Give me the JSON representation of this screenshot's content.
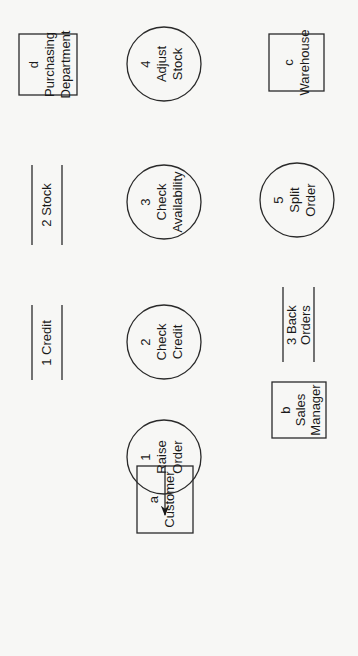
{
  "diagram": {
    "type": "data-flow-diagram",
    "orientation": "rotated -90deg",
    "colors": {
      "background": "#f7f7f5",
      "stroke": "#2a2a2a",
      "text": "#1a1a1a"
    },
    "external_entities": [
      {
        "id": "a",
        "name": "Customer"
      },
      {
        "id": "b",
        "name": "Sales Manager",
        "lines": [
          "Sales",
          "Manager"
        ]
      },
      {
        "id": "c",
        "name": "Warehouse"
      },
      {
        "id": "d",
        "name": "Purchasing Department",
        "lines": [
          "Purchasing",
          "Department"
        ]
      }
    ],
    "processes": [
      {
        "id": "1",
        "lines": [
          "Raise",
          "Order"
        ]
      },
      {
        "id": "2",
        "lines": [
          "Check",
          "Credit"
        ]
      },
      {
        "id": "3",
        "lines": [
          "Check",
          "Availability"
        ]
      },
      {
        "id": "4",
        "lines": [
          "Adjust",
          "Stock"
        ]
      },
      {
        "id": "5",
        "lines": [
          "Split",
          "Order"
        ]
      }
    ],
    "data_stores": [
      {
        "label": "1 Credit"
      },
      {
        "label": "2 Stock"
      },
      {
        "label": "3 Back Orders",
        "lines": [
          "3 Back",
          "Orders"
        ]
      }
    ],
    "flows": {
      "request": "Request",
      "order": "Order",
      "credit": "Credit",
      "accepted_order": [
        "Accepted",
        "Order"
      ],
      "rejected_order": "Rejected Order",
      "stock": "Stock",
      "fully_available_order": [
        "Fully",
        "Available",
        "Order"
      ],
      "partly_available_order": [
        "Partly",
        "Available",
        "Order"
      ],
      "stock_adjustments": [
        "Stock",
        "Adjustments"
      ],
      "available_part_order": [
        "Available",
        "Part Order"
      ],
      "part_order": [
        "Part",
        "Order"
      ],
      "req_notes": [
        "Req.",
        "Notes"
      ],
      "order_details": "Order Details"
    }
  }
}
